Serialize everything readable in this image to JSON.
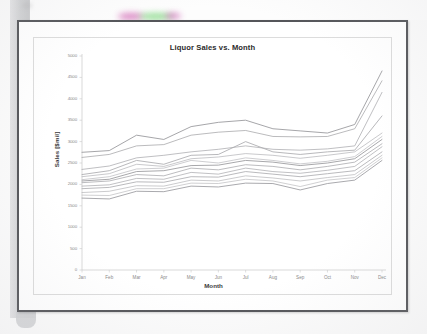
{
  "document": {
    "kind": "scanned-printed-chart",
    "frame_color": "#55565a",
    "card_border_color": "#dcdcdc"
  },
  "chart_data": {
    "type": "line",
    "title": "Liquor Sales vs. Month",
    "xlabel": "Month",
    "ylabel": "Sales [$mil]",
    "categories": [
      "Jan",
      "Feb",
      "Mar",
      "Apr",
      "May",
      "Jun",
      "Jul",
      "Aug",
      "Sep",
      "Oct",
      "Nov",
      "Dec"
    ],
    "ylim": [
      0,
      5000
    ],
    "ytick_values": [
      0,
      500,
      1000,
      1500,
      2000,
      2500,
      3000,
      3500,
      4000,
      4500,
      5000
    ],
    "ytick_labels": [
      "0",
      "500",
      "1000",
      "1500",
      "2000",
      "2500",
      "3000",
      "3500",
      "4000",
      "4500",
      "5000"
    ],
    "grid": false,
    "legend": "none",
    "line_color": "#a9a9ad",
    "series": [
      {
        "name": "Series 1",
        "values": [
          2750,
          2790,
          3150,
          3050,
          3350,
          3450,
          3500,
          3300,
          3250,
          3200,
          3400,
          4650
        ]
      },
      {
        "name": "Series 2",
        "values": [
          2630,
          2700,
          2900,
          2930,
          3150,
          3220,
          3260,
          3120,
          3110,
          3120,
          3300,
          4420
        ]
      },
      {
        "name": "Series 3",
        "values": [
          2350,
          2430,
          2620,
          2680,
          2760,
          2820,
          2900,
          2820,
          2800,
          2830,
          2900,
          4150
        ]
      },
      {
        "name": "Series 4",
        "values": [
          2230,
          2320,
          2560,
          2470,
          2680,
          2700,
          3000,
          2760,
          2700,
          2760,
          2800,
          3600
        ]
      },
      {
        "name": "Series 5",
        "values": [
          2180,
          2250,
          2470,
          2420,
          2600,
          2640,
          2720,
          2680,
          2610,
          2680,
          2760,
          3200
        ]
      },
      {
        "name": "Series 6",
        "values": [
          2110,
          2180,
          2360,
          2380,
          2560,
          2500,
          2620,
          2560,
          2480,
          2540,
          2650,
          3120
        ]
      },
      {
        "name": "Series 7",
        "values": [
          2080,
          2120,
          2300,
          2320,
          2440,
          2450,
          2560,
          2520,
          2440,
          2500,
          2600,
          3050
        ]
      },
      {
        "name": "Series 8",
        "values": [
          2040,
          2080,
          2230,
          2200,
          2380,
          2340,
          2460,
          2420,
          2340,
          2420,
          2520,
          2950
        ]
      },
      {
        "name": "Series 9",
        "values": [
          1960,
          1990,
          2140,
          2120,
          2280,
          2240,
          2380,
          2300,
          2260,
          2330,
          2420,
          2880
        ]
      },
      {
        "name": "Series 10",
        "values": [
          1900,
          1930,
          2060,
          2050,
          2180,
          2170,
          2300,
          2240,
          2180,
          2250,
          2320,
          2760
        ]
      },
      {
        "name": "Series 11",
        "values": [
          1810,
          1840,
          1970,
          1960,
          2100,
          2080,
          2200,
          2150,
          2080,
          2160,
          2230,
          2680
        ]
      },
      {
        "name": "Series 12",
        "values": [
          1750,
          1740,
          1900,
          1900,
          2030,
          2020,
          2120,
          2080,
          1950,
          2100,
          2160,
          2620
        ]
      },
      {
        "name": "Series 13",
        "values": [
          1680,
          1660,
          1840,
          1830,
          1960,
          1940,
          2030,
          2020,
          1870,
          2020,
          2100,
          2560
        ]
      }
    ]
  }
}
